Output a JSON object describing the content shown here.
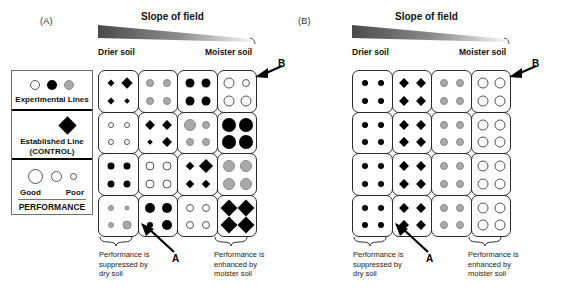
{
  "figure": {
    "panels": [
      {
        "id": "A",
        "label": "(A)"
      },
      {
        "id": "B",
        "label": "(B)"
      }
    ],
    "slope_title": "Slope of field",
    "axis_left_label": "Drier soil",
    "axis_right_label": "Moister soil",
    "pointer_a_label": "A",
    "pointer_b_label": "B",
    "note_left": "Performance is\nsuppressed by\ndry soil",
    "note_right": "Performance is\nenhanced by\nmoister soil"
  },
  "legend": {
    "experimental": {
      "caption": "Experimental Lines",
      "swatches": [
        "white-circle",
        "black-circle",
        "gray-circle"
      ]
    },
    "established": {
      "caption_line1": "Established Line",
      "caption_line2": "(CONTROL)",
      "swatch": "black-diamond"
    },
    "performance": {
      "title": "PERFORMANCE",
      "good_label": "Good",
      "poor_label": "Poor",
      "sizes": [
        13,
        9,
        6
      ]
    }
  },
  "colors": {
    "black": "#000000",
    "gray": "#a9a9a9",
    "white": "#ffffff",
    "outline": "#2a2a2a",
    "slope_dark": "#4a4a4a",
    "slope_light": "#f2f2f2"
  },
  "chart_data": {
    "type": "table",
    "xlabel": "Soil moisture gradient (Drier soil → Moister soil)",
    "ylabel": "Field block (row)",
    "columns": [
      "Col 1 (driest)",
      "Col 2",
      "Col 3",
      "Col 4 (moistest)"
    ],
    "rows": [
      "Row 1",
      "Row 2",
      "Row 3",
      "Row 4"
    ],
    "symbol_legend": {
      "black-diamond": "Established Line (CONTROL)",
      "black-circle": "Experimental line (black)",
      "gray-circle": "Experimental line (gray)",
      "white-circle": "Experimental line (white)"
    },
    "size_legend": {
      "large": "Good performance",
      "small": "Poor performance"
    },
    "panels": [
      {
        "id": "A",
        "label": "(A)",
        "description": "Performance varies across the moisture gradient; each cell holds four symbols whose sizes encode performance.",
        "cells": [
          [
            {
              "type": "black-diamond",
              "sizes": [
                5,
                8,
                5,
                4
              ]
            },
            {
              "type": "gray-circle",
              "sizes": [
                8,
                8,
                8,
                8
              ]
            },
            {
              "type": "black-circle",
              "sizes": [
                9,
                9,
                9,
                9
              ]
            },
            {
              "type": "white-circle",
              "sizes": [
                11,
                8,
                11,
                11
              ]
            }
          ],
          [
            {
              "type": "white-circle",
              "sizes": [
                6,
                6,
                6,
                6
              ]
            },
            {
              "type": "black-diamond",
              "sizes": [
                7,
                7,
                4,
                7
              ]
            },
            {
              "type": "gray-circle",
              "sizes": [
                12,
                8,
                8,
                8
              ]
            },
            {
              "type": "black-circle",
              "sizes": [
                14,
                14,
                14,
                14
              ]
            }
          ],
          [
            {
              "type": "black-circle",
              "sizes": [
                7,
                7,
                7,
                7
              ]
            },
            {
              "type": "white-circle",
              "sizes": [
                9,
                9,
                9,
                9
              ]
            },
            {
              "type": "black-diamond",
              "sizes": [
                6,
                10,
                6,
                6
              ]
            },
            {
              "type": "gray-circle",
              "sizes": [
                12,
                12,
                12,
                12
              ]
            }
          ],
          [
            {
              "type": "gray-circle",
              "sizes": [
                6,
                5,
                6,
                9
              ]
            },
            {
              "type": "black-circle",
              "sizes": [
                10,
                10,
                6,
                10
              ]
            },
            {
              "type": "white-circle",
              "sizes": [
                8,
                8,
                8,
                8
              ]
            },
            {
              "type": "black-diamond",
              "sizes": [
                12,
                12,
                12,
                12
              ]
            }
          ]
        ]
      },
      {
        "id": "B",
        "label": "(B)",
        "description": "Uniform performance: every row is identical; symbol type varies only by column.",
        "cells": [
          [
            {
              "type": "black-circle",
              "sizes": [
                6,
                6,
                6,
                6
              ]
            },
            {
              "type": "black-diamond",
              "sizes": [
                7,
                7,
                7,
                7
              ]
            },
            {
              "type": "gray-circle",
              "sizes": [
                8,
                8,
                8,
                8
              ]
            },
            {
              "type": "white-circle",
              "sizes": [
                11,
                11,
                11,
                11
              ]
            }
          ],
          [
            {
              "type": "black-circle",
              "sizes": [
                6,
                6,
                6,
                6
              ]
            },
            {
              "type": "black-diamond",
              "sizes": [
                7,
                7,
                7,
                7
              ]
            },
            {
              "type": "gray-circle",
              "sizes": [
                8,
                8,
                8,
                8
              ]
            },
            {
              "type": "white-circle",
              "sizes": [
                11,
                11,
                11,
                11
              ]
            }
          ],
          [
            {
              "type": "black-circle",
              "sizes": [
                6,
                6,
                6,
                6
              ]
            },
            {
              "type": "black-diamond",
              "sizes": [
                7,
                7,
                7,
                7
              ]
            },
            {
              "type": "gray-circle",
              "sizes": [
                8,
                8,
                8,
                8
              ]
            },
            {
              "type": "white-circle",
              "sizes": [
                11,
                11,
                11,
                11
              ]
            }
          ],
          [
            {
              "type": "black-circle",
              "sizes": [
                6,
                6,
                6,
                6
              ]
            },
            {
              "type": "black-diamond",
              "sizes": [
                7,
                7,
                7,
                7
              ]
            },
            {
              "type": "gray-circle",
              "sizes": [
                8,
                8,
                8,
                8
              ]
            },
            {
              "type": "white-circle",
              "sizes": [
                11,
                11,
                11,
                11
              ]
            }
          ]
        ]
      }
    ]
  }
}
